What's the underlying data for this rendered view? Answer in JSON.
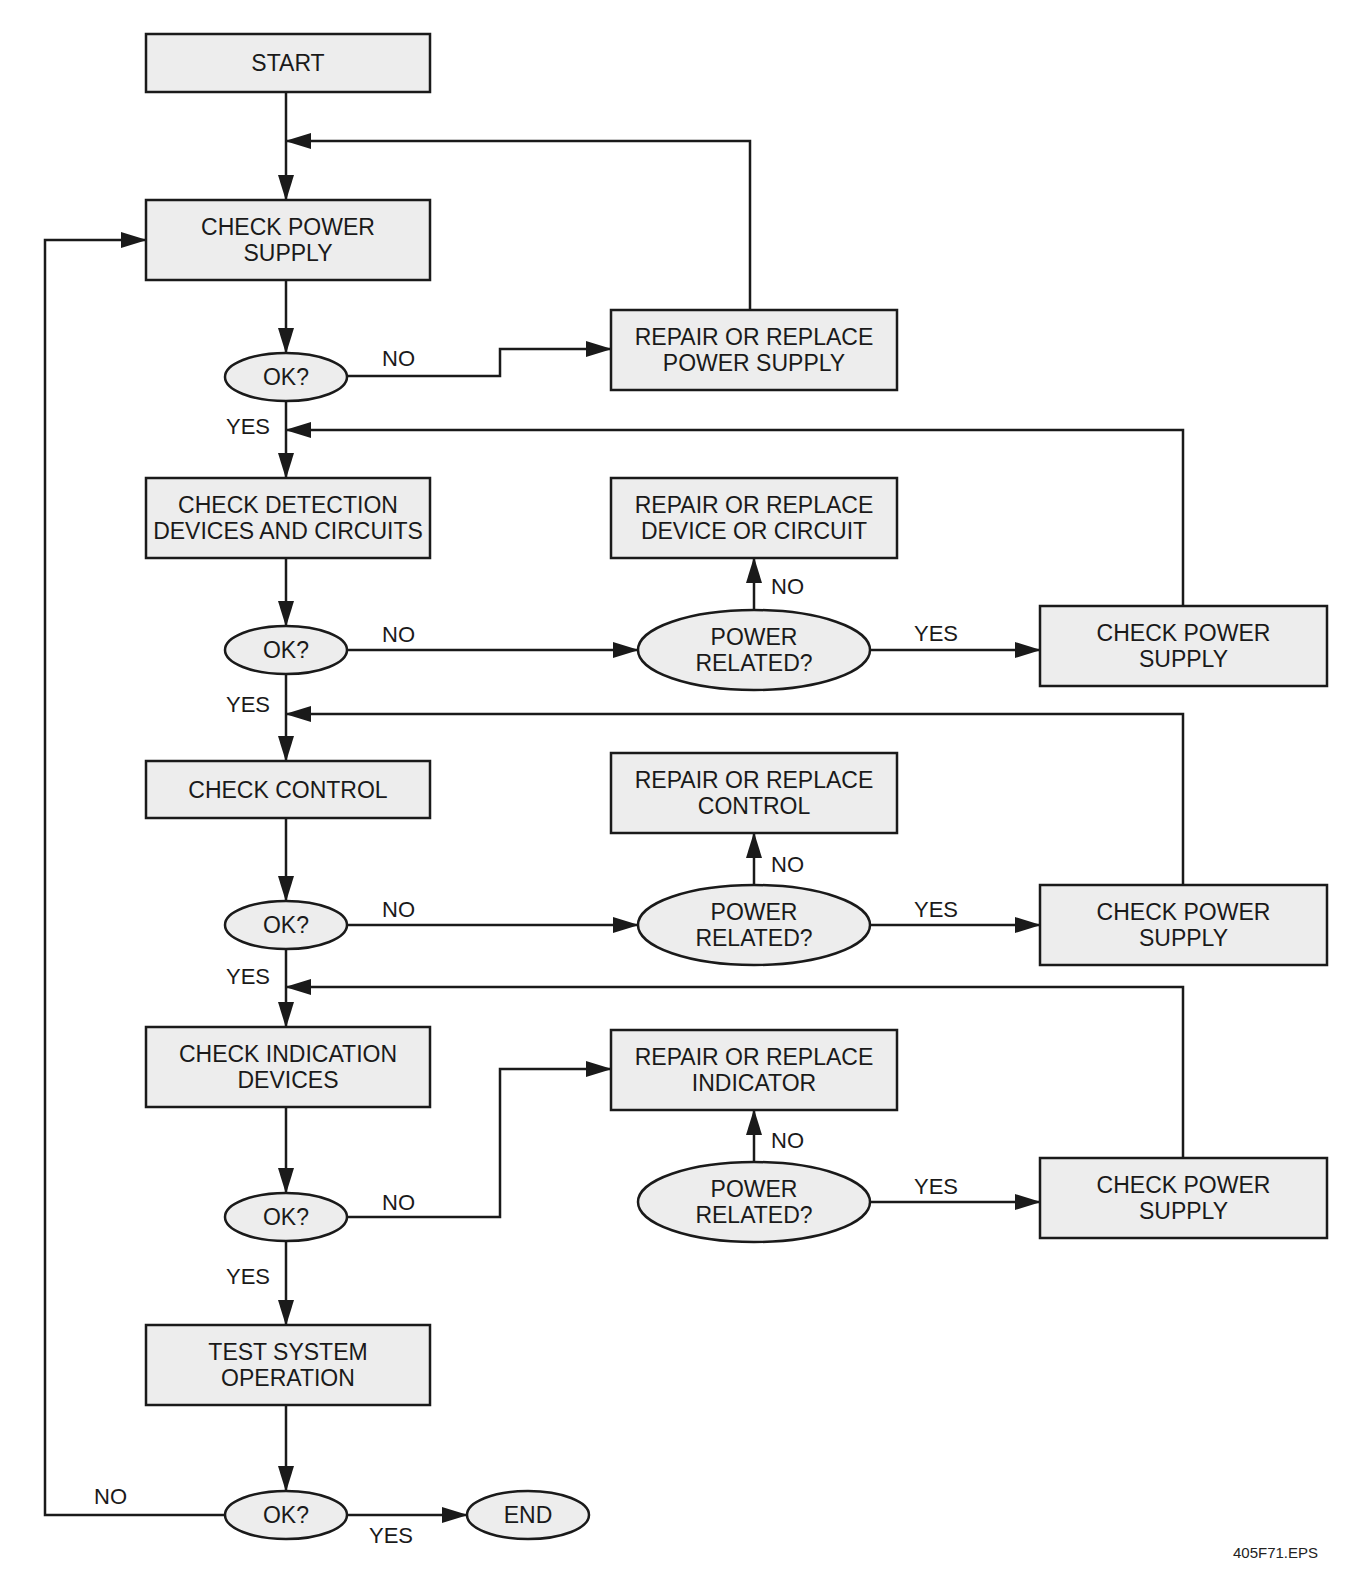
{
  "diagram": {
    "type": "flowchart",
    "caption": "405F71.EPS",
    "colors": {
      "node_fill": "#ededed",
      "stroke": "#1a1a1a",
      "text": "#1a1a1a",
      "background": "#ffffff"
    },
    "nodes": [
      {
        "id": "start",
        "shape": "rect",
        "x": 146,
        "y": 34,
        "w": 284,
        "h": 58,
        "lines": [
          "START"
        ]
      },
      {
        "id": "check_power_supply",
        "shape": "rect",
        "x": 146,
        "y": 200,
        "w": 284,
        "h": 80,
        "lines": [
          "CHECK POWER",
          "SUPPLY"
        ]
      },
      {
        "id": "ok1",
        "shape": "oval",
        "cx": 286,
        "cy": 377,
        "rx": 61,
        "ry": 24,
        "lines": [
          "OK?"
        ]
      },
      {
        "id": "repair_power_supply",
        "shape": "rect",
        "x": 611,
        "y": 310,
        "w": 286,
        "h": 80,
        "lines": [
          "REPAIR OR REPLACE",
          "POWER SUPPLY"
        ]
      },
      {
        "id": "check_detection",
        "shape": "rect",
        "x": 146,
        "y": 478,
        "w": 284,
        "h": 80,
        "lines": [
          "CHECK DETECTION",
          "DEVICES AND CIRCUITS"
        ]
      },
      {
        "id": "ok2",
        "shape": "oval",
        "cx": 286,
        "cy": 650,
        "rx": 61,
        "ry": 24,
        "lines": [
          "OK?"
        ]
      },
      {
        "id": "repair_device",
        "shape": "rect",
        "x": 611,
        "y": 478,
        "w": 286,
        "h": 80,
        "lines": [
          "REPAIR OR REPLACE",
          "DEVICE OR CIRCUIT"
        ]
      },
      {
        "id": "power_related1",
        "shape": "oval",
        "cx": 754,
        "cy": 650,
        "rx": 116,
        "ry": 40,
        "lines": [
          "POWER",
          "RELATED?"
        ]
      },
      {
        "id": "check_power_supply2",
        "shape": "rect",
        "x": 1040,
        "y": 606,
        "w": 287,
        "h": 80,
        "lines": [
          "CHECK POWER",
          "SUPPLY"
        ]
      },
      {
        "id": "check_control",
        "shape": "rect",
        "x": 146,
        "y": 761,
        "w": 284,
        "h": 57,
        "lines": [
          "CHECK CONTROL"
        ]
      },
      {
        "id": "ok3",
        "shape": "oval",
        "cx": 286,
        "cy": 925,
        "rx": 61,
        "ry": 24,
        "lines": [
          "OK?"
        ]
      },
      {
        "id": "repair_control",
        "shape": "rect",
        "x": 611,
        "y": 753,
        "w": 286,
        "h": 80,
        "lines": [
          "REPAIR OR REPLACE",
          "CONTROL"
        ]
      },
      {
        "id": "power_related2",
        "shape": "oval",
        "cx": 754,
        "cy": 925,
        "rx": 116,
        "ry": 40,
        "lines": [
          "POWER",
          "RELATED?"
        ]
      },
      {
        "id": "check_power_supply3",
        "shape": "rect",
        "x": 1040,
        "y": 885,
        "w": 287,
        "h": 80,
        "lines": [
          "CHECK POWER",
          "SUPPLY"
        ]
      },
      {
        "id": "check_indication",
        "shape": "rect",
        "x": 146,
        "y": 1027,
        "w": 284,
        "h": 80,
        "lines": [
          "CHECK INDICATION",
          "DEVICES"
        ]
      },
      {
        "id": "ok4",
        "shape": "oval",
        "cx": 286,
        "cy": 1217,
        "rx": 61,
        "ry": 24,
        "lines": [
          "OK?"
        ]
      },
      {
        "id": "repair_indicator",
        "shape": "rect",
        "x": 611,
        "y": 1030,
        "w": 286,
        "h": 80,
        "lines": [
          "REPAIR OR REPLACE",
          "INDICATOR"
        ]
      },
      {
        "id": "power_related3",
        "shape": "oval",
        "cx": 754,
        "cy": 1202,
        "rx": 116,
        "ry": 40,
        "lines": [
          "POWER",
          "RELATED?"
        ]
      },
      {
        "id": "check_power_supply4",
        "shape": "rect",
        "x": 1040,
        "y": 1158,
        "w": 287,
        "h": 80,
        "lines": [
          "CHECK POWER",
          "SUPPLY"
        ]
      },
      {
        "id": "test_system",
        "shape": "rect",
        "x": 146,
        "y": 1325,
        "w": 284,
        "h": 80,
        "lines": [
          "TEST SYSTEM",
          "OPERATION"
        ]
      },
      {
        "id": "ok5",
        "shape": "oval",
        "cx": 286,
        "cy": 1515,
        "rx": 61,
        "ry": 24,
        "lines": [
          "OK?"
        ]
      },
      {
        "id": "end",
        "shape": "oval",
        "cx": 528,
        "cy": 1515,
        "rx": 61,
        "ry": 24,
        "lines": [
          "END"
        ]
      }
    ],
    "edges": [
      {
        "from": "start",
        "to": "check_power_supply",
        "points": [
          [
            286,
            92
          ],
          [
            286,
            200
          ]
        ],
        "arrow": true
      },
      {
        "from": "check_power_supply",
        "to": "ok1",
        "points": [
          [
            286,
            280
          ],
          [
            286,
            353
          ]
        ],
        "arrow": true
      },
      {
        "from": "ok1",
        "to": "repair_power_supply",
        "label": "NO",
        "points": [
          [
            347,
            376
          ],
          [
            500,
            376
          ],
          [
            500,
            349
          ],
          [
            611,
            349
          ]
        ],
        "arrow": true
      },
      {
        "from": "repair_power_supply",
        "to": "check_power_supply",
        "points": [
          [
            750,
            310
          ],
          [
            750,
            141
          ],
          [
            286,
            141
          ]
        ],
        "arrow": true
      },
      {
        "from": "ok1",
        "to": "check_detection",
        "label": "YES",
        "points": [
          [
            286,
            401
          ],
          [
            286,
            478
          ]
        ],
        "arrow": true
      },
      {
        "from": "check_power_supply2",
        "to": "check_detection",
        "points": [
          [
            1183,
            606
          ],
          [
            1183,
            430
          ],
          [
            286,
            430
          ]
        ],
        "arrow": true
      },
      {
        "from": "check_detection",
        "to": "ok2",
        "points": [
          [
            286,
            558
          ],
          [
            286,
            626
          ]
        ],
        "arrow": true
      },
      {
        "from": "ok2",
        "to": "power_related1",
        "label": "NO",
        "points": [
          [
            347,
            650
          ],
          [
            638,
            650
          ]
        ],
        "arrow": true
      },
      {
        "from": "power_related1",
        "to": "repair_device",
        "label": "NO",
        "points": [
          [
            754,
            610
          ],
          [
            754,
            558
          ]
        ],
        "arrow": true
      },
      {
        "from": "power_related1",
        "to": "check_power_supply2",
        "label": "YES",
        "points": [
          [
            870,
            650
          ],
          [
            1040,
            650
          ]
        ],
        "arrow": true
      },
      {
        "from": "ok2",
        "to": "check_control",
        "label": "YES",
        "points": [
          [
            286,
            674
          ],
          [
            286,
            761
          ]
        ],
        "arrow": true
      },
      {
        "from": "check_power_supply3",
        "to": "check_control",
        "points": [
          [
            1183,
            885
          ],
          [
            1183,
            714
          ],
          [
            286,
            714
          ]
        ],
        "arrow": true
      },
      {
        "from": "check_control",
        "to": "ok3",
        "points": [
          [
            286,
            818
          ],
          [
            286,
            901
          ]
        ],
        "arrow": true
      },
      {
        "from": "ok3",
        "to": "power_related2",
        "label": "NO",
        "points": [
          [
            347,
            925
          ],
          [
            638,
            925
          ]
        ],
        "arrow": true
      },
      {
        "from": "power_related2",
        "to": "repair_control",
        "label": "NO",
        "points": [
          [
            754,
            885
          ],
          [
            754,
            833
          ]
        ],
        "arrow": true
      },
      {
        "from": "power_related2",
        "to": "check_power_supply3",
        "label": "YES",
        "points": [
          [
            870,
            925
          ],
          [
            1040,
            925
          ]
        ],
        "arrow": true
      },
      {
        "from": "ok3",
        "to": "check_indication",
        "label": "YES",
        "points": [
          [
            286,
            949
          ],
          [
            286,
            1027
          ]
        ],
        "arrow": true
      },
      {
        "from": "check_power_supply4",
        "to": "check_indication",
        "points": [
          [
            1183,
            1158
          ],
          [
            1183,
            987
          ],
          [
            286,
            987
          ]
        ],
        "arrow": true
      },
      {
        "from": "check_indication",
        "to": "ok4",
        "points": [
          [
            286,
            1107
          ],
          [
            286,
            1193
          ]
        ],
        "arrow": true
      },
      {
        "from": "ok4",
        "to": "repair_indicator",
        "label": "NO",
        "points": [
          [
            347,
            1217
          ],
          [
            500,
            1217
          ],
          [
            500,
            1069
          ],
          [
            611,
            1069
          ]
        ],
        "arrow": true
      },
      {
        "from": "power_related3",
        "to": "repair_indicator",
        "label": "NO",
        "points": [
          [
            754,
            1162
          ],
          [
            754,
            1110
          ]
        ],
        "arrow": true
      },
      {
        "from": "power_related3",
        "to": "check_power_supply4",
        "label": "YES",
        "points": [
          [
            870,
            1202
          ],
          [
            1040,
            1202
          ]
        ],
        "arrow": true
      },
      {
        "from": "ok4",
        "to": "test_system",
        "label": "YES",
        "points": [
          [
            286,
            1241
          ],
          [
            286,
            1325
          ]
        ],
        "arrow": true
      },
      {
        "from": "test_system",
        "to": "ok5",
        "points": [
          [
            286,
            1405
          ],
          [
            286,
            1491
          ]
        ],
        "arrow": true
      },
      {
        "from": "ok5",
        "to": "end",
        "label": "YES",
        "points": [
          [
            347,
            1515
          ],
          [
            467,
            1515
          ]
        ],
        "arrow": true
      },
      {
        "from": "ok5",
        "to": "check_power_supply",
        "label": "NO",
        "points": [
          [
            225,
            1515
          ],
          [
            45,
            1515
          ],
          [
            45,
            240
          ],
          [
            146,
            240
          ]
        ],
        "arrow": true
      }
    ],
    "edge_labels": [
      {
        "text": "NO",
        "x": 382,
        "y": 366
      },
      {
        "text": "YES",
        "x": 226,
        "y": 434
      },
      {
        "text": "NO",
        "x": 382,
        "y": 642
      },
      {
        "text": "NO",
        "x": 771,
        "y": 594
      },
      {
        "text": "YES",
        "x": 914,
        "y": 641
      },
      {
        "text": "YES",
        "x": 226,
        "y": 712
      },
      {
        "text": "NO",
        "x": 382,
        "y": 917
      },
      {
        "text": "NO",
        "x": 771,
        "y": 872
      },
      {
        "text": "YES",
        "x": 914,
        "y": 917
      },
      {
        "text": "YES",
        "x": 226,
        "y": 984
      },
      {
        "text": "NO",
        "x": 382,
        "y": 1210
      },
      {
        "text": "NO",
        "x": 771,
        "y": 1148
      },
      {
        "text": "YES",
        "x": 914,
        "y": 1194
      },
      {
        "text": "YES",
        "x": 226,
        "y": 1284
      },
      {
        "text": "NO",
        "x": 94,
        "y": 1504
      },
      {
        "text": "YES",
        "x": 369,
        "y": 1543
      }
    ],
    "caption_pos": {
      "x": 1233,
      "y": 1558
    }
  }
}
